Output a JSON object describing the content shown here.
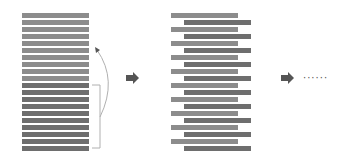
{
  "diagram": {
    "colors": {
      "light_bar": "#8c8c8c",
      "dark_bar": "#6e6e6e",
      "arrow": "#555555",
      "connector": "#b0b0b0"
    },
    "left_stack": {
      "x": 22,
      "width": 67,
      "top": 13,
      "pitch": 7,
      "bar_height": 5,
      "count": 20,
      "upper_half_count": 10,
      "lower_half_count": 10
    },
    "middle_stack": {
      "top": 13,
      "pitch": 7,
      "bar_height": 5,
      "count": 20,
      "light_x": 171,
      "dark_x": 184,
      "width": 67,
      "pattern": "alternating light/dark, dark offset to the right"
    },
    "arrows": [
      {
        "name": "arrow-1",
        "x": 125,
        "y": 74
      },
      {
        "name": "arrow-2",
        "x": 281,
        "y": 74
      }
    ],
    "ellipsis": {
      "text": "······",
      "x": 303,
      "y": 77
    }
  }
}
